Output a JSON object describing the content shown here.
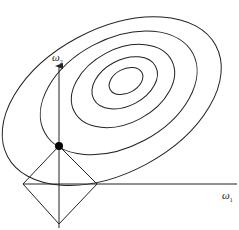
{
  "diagram": {
    "type": "L1 regularization geometry",
    "axes": {
      "x_label": "ω",
      "x_sub": "1",
      "y_label": "ω",
      "y_sub": "2"
    },
    "colors": {
      "stroke": "#222222",
      "background": "#ffffff",
      "point": "#000000"
    },
    "contours": [
      {
        "cx": 126,
        "cy": 81,
        "rx": 17,
        "ry": 13
      },
      {
        "cx": 126,
        "cy": 82,
        "rx": 33,
        "ry": 24
      },
      {
        "cx": 124,
        "cy": 85,
        "rx": 52,
        "ry": 38
      },
      {
        "cx": 120,
        "cy": 90,
        "rx": 80,
        "ry": 54
      },
      {
        "cx": 112,
        "cy": 92,
        "rx": 110,
        "ry": 78
      }
    ],
    "constraint_region": {
      "shape": "diamond",
      "left": [
        23,
        184
      ],
      "top": [
        59,
        146
      ],
      "right": [
        97,
        184
      ],
      "bottom": [
        59,
        224
      ]
    },
    "solution_point": {
      "x": 59,
      "y": 146
    }
  }
}
